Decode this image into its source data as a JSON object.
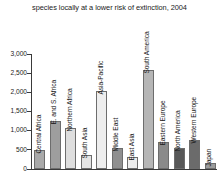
{
  "chart_data": {
    "type": "bar",
    "title": "species locally at a lower risk of extinction, 2004",
    "xlabel": "",
    "ylabel": "",
    "ylim": [
      0,
      3000
    ],
    "yticks": [
      0,
      500,
      1000,
      1500,
      2000,
      2500,
      3000
    ],
    "ytick_labels": [
      "0",
      "500",
      "1,000",
      "1,500",
      "2,000",
      "2,500",
      "3,000"
    ],
    "grid": false,
    "legend": "none",
    "categories": [
      "Central Africa",
      "E. and S. Africa",
      "Northern Africa",
      "South Asia",
      "Asia-Pacific",
      "Middle East",
      "East Asia",
      "South America",
      "Eastern Europe",
      "North America",
      "Western Europe",
      "Japan"
    ],
    "values": [
      500,
      1250,
      1080,
      370,
      2030,
      560,
      320,
      2570,
      700,
      550,
      760,
      160
    ],
    "bar_colors": [
      "#a9a9a9",
      "#9e9e9e",
      "#dedede",
      "#e4e4e4",
      "#eeeeee",
      "#8f8f8f",
      "#ededed",
      "#b6b6b6",
      "#8a8a8a",
      "#585858",
      "#6b6b6b",
      "#9c9c9c"
    ]
  },
  "colors": {
    "background": "#ffffff",
    "axis": "#3a3a3a",
    "text": "#222222",
    "bar_outline": "#6d6d6d"
  }
}
